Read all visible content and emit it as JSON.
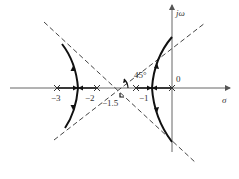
{
  "diagram": {
    "type": "root-locus",
    "axes": {
      "real_axis_label": "σ",
      "imag_axis_label": "jω",
      "origin_label": "0"
    },
    "poles": [
      {
        "value": -3,
        "label": "−3"
      },
      {
        "value": -2,
        "label": "−2"
      },
      {
        "value": -1,
        "label": "−1"
      },
      {
        "value": 0,
        "label": ""
      }
    ],
    "asymptotes": {
      "centroid": -1.5,
      "centroid_label": "−1.5",
      "angle_label": "45°",
      "angles_deg": [
        45,
        135,
        225,
        315
      ]
    },
    "branches": [
      {
        "name": "left-branch",
        "description": "breaks away between −3 and −2, heads to upper-left and lower-left along asymptotes"
      },
      {
        "name": "right-branch",
        "description": "breaks away between −1 and 0, heads to upper-right and lower-right along asymptotes"
      }
    ],
    "colors": {
      "axis": "#555555",
      "locus": "#111111",
      "asymptote": "#444444",
      "text": "#333333"
    }
  }
}
